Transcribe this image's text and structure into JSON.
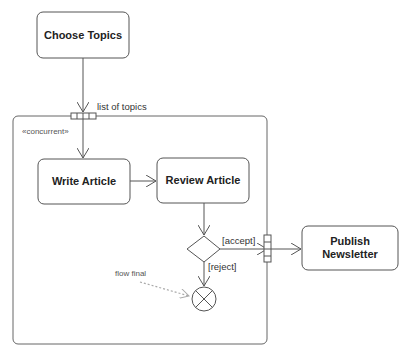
{
  "diagram": {
    "type": "UML activity diagram",
    "region": {
      "stereotype": "«concurrent»",
      "input_pin_label": "list of topics"
    },
    "actions": [
      {
        "id": "choose",
        "label": "Choose Topics"
      },
      {
        "id": "write",
        "label": "Write Article"
      },
      {
        "id": "review",
        "label": "Review Article"
      },
      {
        "id": "publish",
        "label_line1": "Publish",
        "label_line2": "Newsletter"
      }
    ],
    "guards": {
      "accept": "[accept]",
      "reject": "[reject]"
    },
    "annotations": {
      "flow_final": "flow final"
    },
    "colors": {
      "stroke": "#555555",
      "text": "#222222",
      "annotation": "#999999"
    }
  }
}
